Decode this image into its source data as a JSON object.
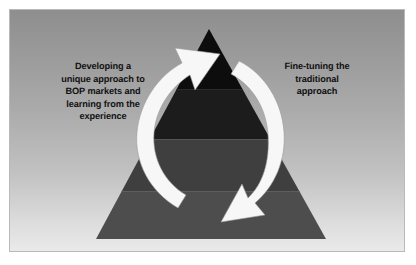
{
  "figure": {
    "background": {
      "frame_border_color": "#b9b9b9",
      "gradient_top_color": "#8e8e8e",
      "gradient_bottom_color": "#eaeaea",
      "page_color": "#ffffff"
    }
  },
  "labels": {
    "left": {
      "name": "developing-approach-label",
      "lines": [
        "Developing a",
        "unique approach to",
        "BOP markets and",
        "learning from the",
        "experience"
      ],
      "color": "#111111"
    },
    "right": {
      "name": "fine-tuning-label",
      "lines": [
        "Fine-tuning the",
        "traditional",
        "approach"
      ],
      "color": "#111111"
    }
  },
  "pyramid": {
    "apex": {
      "x": 199,
      "y": 19
    },
    "base_left": {
      "x": 86,
      "y": 229
    },
    "base_right": {
      "x": 316,
      "y": 229
    },
    "bands": [
      {
        "name": "apex-tier",
        "top_y": 19,
        "bottom_y": 79,
        "color": "#0d0d0d"
      },
      {
        "name": "upper-middle-tier",
        "top_y": 79,
        "bottom_y": 129,
        "color": "#1c1c1c"
      },
      {
        "name": "lower-middle-tier",
        "top_y": 129,
        "bottom_y": 181,
        "color": "#3f3f3f"
      },
      {
        "name": "base-tier",
        "top_y": 181,
        "bottom_y": 229,
        "color": "#4d4d4d"
      }
    ],
    "band_divider_color": "#5a5a5a"
  },
  "arrows": {
    "color": "#f7f7f7",
    "outline_color": "#8a8a8a",
    "left": {
      "name": "ascending-arrow",
      "direction": "upward",
      "description": "curves from lower-left of pyramid up to the apex"
    },
    "right": {
      "name": "descending-arrow",
      "direction": "downward",
      "description": "curves from the apex down to the lower-right of pyramid"
    }
  }
}
